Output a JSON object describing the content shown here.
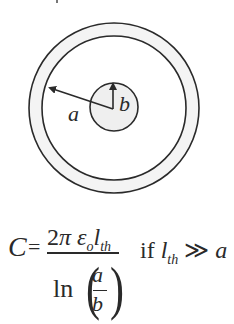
{
  "diagram": {
    "labels": {
      "outer_radius": "a",
      "inner_radius": "b"
    },
    "geometry": {
      "center": [
        114,
        108
      ],
      "outer_shell_outer_radius": 85,
      "outer_shell_inner_radius": 72,
      "inner_conductor_radius": 24
    },
    "colors": {
      "stroke": "#2a2a2a",
      "shell_fill": "#f2f2f2",
      "inner_fill": "#eeeeee",
      "background": "#ffffff"
    }
  },
  "formula": {
    "lhs": "C",
    "equals": "=",
    "numerator": {
      "coef": "2",
      "pi": "π",
      "epsilon": "ε",
      "epsilon_sub": "o",
      "length": "l",
      "length_sub": "th"
    },
    "denominator": {
      "func": "ln",
      "open_paren": "(",
      "close_paren": ")",
      "top": "a",
      "bottom": "b"
    },
    "condition": {
      "prefix": "if ",
      "var": "l",
      "var_sub": "th",
      "op": " ≫ ",
      "rhs": "a"
    }
  }
}
